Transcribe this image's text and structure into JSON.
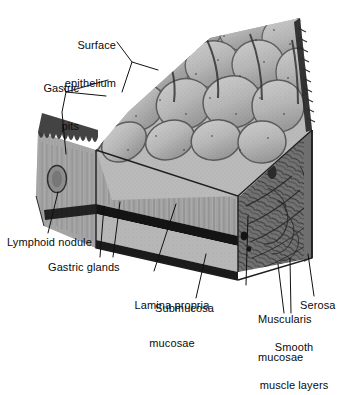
{
  "figure": {
    "type": "anatomical-illustration",
    "style": "grayscale halftone line drawing",
    "palette": {
      "background": "#ffffff",
      "ruga_light": "#c9c9c9",
      "ruga_mid": "#b3b3b3",
      "ruga_shadow": "#8a8a8a",
      "groove_dark": "#3a3a3a",
      "lamina_propria": "#a9a9a9",
      "submucosa": "#b2b2b2",
      "muscularis_mucosae": "#1a1a1a",
      "muscle_layer": "#7d7d7d",
      "serosa": "#909090",
      "ink": "#0b0b0b",
      "leader_line": "#111111"
    }
  },
  "labels": [
    {
      "id": "surface-epithelium",
      "line1": "Surface",
      "line2": "epithelium",
      "x": 115,
      "y": 14,
      "align": "right"
    },
    {
      "id": "gastric-pits",
      "line1": "Gastric",
      "line2": "pits",
      "x": 78,
      "y": 57,
      "align": "right"
    },
    {
      "id": "lymphoid-nodule",
      "text": "Lymphoid nodule",
      "x": 7,
      "y": 236,
      "align": "left"
    },
    {
      "id": "gastric-glands",
      "text": "Gastric glands",
      "x": 48,
      "y": 261,
      "align": "left"
    },
    {
      "id": "lamina-propria-mucosae",
      "line1": "Lamina propria",
      "line2": "mucosae",
      "x": 172,
      "y": 274,
      "align": "center"
    },
    {
      "id": "submucosa",
      "text": "Submucosa",
      "x": 155,
      "y": 302,
      "align": "left"
    },
    {
      "id": "muscularis-mucosae",
      "line1": "Muscularis",
      "line2": "mucosae",
      "x": 258,
      "y": 288,
      "align": "left"
    },
    {
      "id": "smooth-muscle-layers",
      "line1": "Smooth",
      "line2": "muscle layers",
      "x": 294,
      "y": 316,
      "align": "center"
    },
    {
      "id": "serosa",
      "text": "Serosa",
      "x": 300,
      "y": 299,
      "align": "left"
    }
  ],
  "structures": [
    {
      "id": "rugae-surface",
      "name": "Surface epithelium over gastric rugae"
    },
    {
      "id": "gastric-pits-region",
      "name": "Gastric pits"
    },
    {
      "id": "gastric-glands-region",
      "name": "Gastric glands in cut face"
    },
    {
      "id": "lymphoid-nodule-body",
      "name": "Lymphoid nodule"
    },
    {
      "id": "lamina-propria-band",
      "name": "Lamina propria mucosae"
    },
    {
      "id": "muscularis-mucosae-band",
      "name": "Muscularis mucosae"
    },
    {
      "id": "submucosa-band",
      "name": "Submucosa"
    },
    {
      "id": "smooth-muscle-block",
      "name": "Smooth muscle layers"
    },
    {
      "id": "serosa-edge",
      "name": "Serosa"
    }
  ]
}
